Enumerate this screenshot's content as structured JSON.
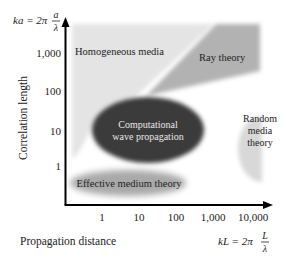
{
  "diagram": {
    "y_axis": {
      "label": "Correlation length",
      "formula_lhs": "ka = 2π",
      "formula_num": "a",
      "formula_den": "λ",
      "ticks": [
        "1",
        "10",
        "100",
        "1,000"
      ]
    },
    "x_axis": {
      "label": "Propagation distance",
      "formula_lhs": "kL = 2π",
      "formula_num": "L",
      "formula_den": "λ",
      "ticks": [
        "1",
        "10",
        "100",
        "1,000",
        "10,000"
      ]
    },
    "regions": {
      "homogeneous": {
        "label": "Homogeneous media",
        "color": "#e4e4e4"
      },
      "ray": {
        "label": "Ray theory",
        "color": "#b2b2b2"
      },
      "computational": {
        "line1": "Computational",
        "line2": "wave propagation",
        "color": "#3b3b3b",
        "text_color": "#e8e8e8"
      },
      "random": {
        "line1": "Random",
        "line2": "media",
        "line3": "theory",
        "color": "#d8d8d8"
      },
      "effective": {
        "label": "Effective medium theory",
        "color": "#a9a9a9"
      }
    }
  }
}
